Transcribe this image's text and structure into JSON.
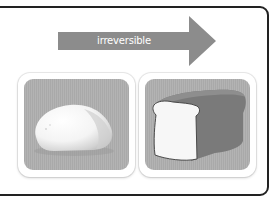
{
  "diagram": {
    "arrow": {
      "label": "irreversible",
      "direction": "right",
      "color": "#8c8c8c"
    },
    "panels": [
      {
        "id": "dough",
        "description": "raw bread dough ball",
        "tile_color": "#aeaeae"
      },
      {
        "id": "bread",
        "description": "baked loaf of bread with a cut slice face",
        "tile_color": "#aeaeae"
      }
    ],
    "frame_border_color": "#222222"
  }
}
